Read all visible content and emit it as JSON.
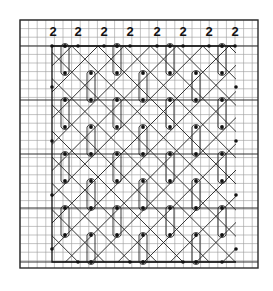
{
  "diagram": {
    "type": "lace-pricking-grid",
    "canvas": {
      "width": 273,
      "height": 291,
      "background": "#ffffff"
    },
    "grid": {
      "x0": 20,
      "y0": 20,
      "x1": 258,
      "y1": 268,
      "cell": 8.6,
      "bold_every_rows_at": [
        46,
        100,
        154,
        208,
        262
      ],
      "bold_cols_at": [
        20,
        52,
        258
      ],
      "fine_color": "#9a9a9a",
      "bold_color": "#333333"
    },
    "column_labels": {
      "y": 36,
      "items": [
        {
          "x": 53,
          "text": "2"
        },
        {
          "x": 78,
          "text": "2"
        },
        {
          "x": 104,
          "text": "2"
        },
        {
          "x": 130,
          "text": "2"
        },
        {
          "x": 157,
          "text": "2"
        },
        {
          "x": 183,
          "text": "2"
        },
        {
          "x": 209,
          "text": "2"
        },
        {
          "x": 235,
          "text": "2"
        }
      ]
    },
    "outline": {
      "top_y": 46,
      "bottom_y": 262,
      "left_x": 52,
      "right_x": 236
    },
    "plain_pins": [
      [
        52,
        46
      ],
      [
        78,
        46
      ],
      [
        104,
        46
      ],
      [
        130,
        46
      ],
      [
        157,
        46
      ],
      [
        183,
        46
      ],
      [
        209,
        46
      ],
      [
        235,
        46
      ],
      [
        52,
        87
      ],
      [
        52,
        141
      ],
      [
        52,
        195
      ],
      [
        52,
        249
      ],
      [
        236,
        87
      ],
      [
        236,
        141
      ],
      [
        236,
        195
      ],
      [
        236,
        249
      ],
      [
        78,
        262
      ],
      [
        130,
        262
      ],
      [
        183,
        262
      ],
      [
        222,
        262
      ]
    ],
    "loops": [
      {
        "x": 65,
        "y1": 46,
        "y2": 73
      },
      {
        "x": 117,
        "y1": 46,
        "y2": 73
      },
      {
        "x": 170,
        "y1": 46,
        "y2": 73
      },
      {
        "x": 222,
        "y1": 46,
        "y2": 73
      },
      {
        "x": 91,
        "y1": 73,
        "y2": 100
      },
      {
        "x": 143,
        "y1": 73,
        "y2": 100
      },
      {
        "x": 196,
        "y1": 73,
        "y2": 100
      },
      {
        "x": 65,
        "y1": 100,
        "y2": 127
      },
      {
        "x": 117,
        "y1": 100,
        "y2": 127
      },
      {
        "x": 170,
        "y1": 100,
        "y2": 127
      },
      {
        "x": 222,
        "y1": 100,
        "y2": 127
      },
      {
        "x": 91,
        "y1": 127,
        "y2": 154
      },
      {
        "x": 143,
        "y1": 127,
        "y2": 154
      },
      {
        "x": 196,
        "y1": 127,
        "y2": 154
      },
      {
        "x": 65,
        "y1": 154,
        "y2": 181
      },
      {
        "x": 117,
        "y1": 154,
        "y2": 181
      },
      {
        "x": 170,
        "y1": 154,
        "y2": 181
      },
      {
        "x": 222,
        "y1": 154,
        "y2": 181
      },
      {
        "x": 91,
        "y1": 181,
        "y2": 208
      },
      {
        "x": 143,
        "y1": 181,
        "y2": 208
      },
      {
        "x": 196,
        "y1": 181,
        "y2": 208
      },
      {
        "x": 65,
        "y1": 208,
        "y2": 235
      },
      {
        "x": 117,
        "y1": 208,
        "y2": 235
      },
      {
        "x": 170,
        "y1": 208,
        "y2": 235
      },
      {
        "x": 222,
        "y1": 208,
        "y2": 235
      },
      {
        "x": 91,
        "y1": 235,
        "y2": 262
      },
      {
        "x": 143,
        "y1": 235,
        "y2": 262
      },
      {
        "x": 196,
        "y1": 235,
        "y2": 262
      }
    ],
    "diagonal_spacing": 26.2,
    "colors": {
      "ink": "#111111",
      "thread": "#222222"
    }
  }
}
